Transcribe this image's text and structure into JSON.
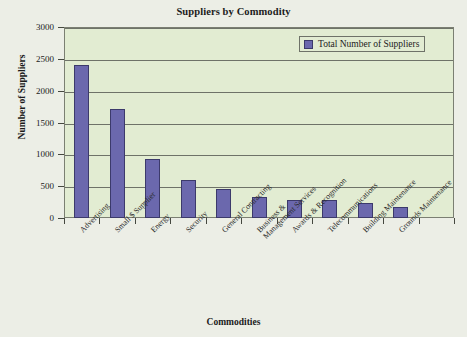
{
  "chart_data": {
    "type": "bar",
    "title": "Suppliers by Commodity",
    "xlabel": "Commodities",
    "ylabel": "Number of Suppliers",
    "ylim": [
      0,
      3000
    ],
    "ytick_step": 500,
    "yticks": [
      0,
      500,
      1000,
      1500,
      2000,
      2500,
      3000
    ],
    "ytick_labels": [
      "0",
      "500",
      "1000",
      "1500",
      "2000",
      "2500",
      "3000"
    ],
    "grid": true,
    "legend_position": "top-right",
    "legend": [
      "Total Number of Suppliers"
    ],
    "categories": [
      "Advertising",
      "Small $ Supplier",
      "Energy",
      "Security",
      "General Contracting",
      "Business & Management Services",
      "Awards & Recognition",
      "Telecommunications",
      "Building Maintenance",
      "Grounds Maintenance"
    ],
    "series": [
      {
        "name": "Total Number of Suppliers",
        "color": "#6B68AD",
        "values": [
          2400,
          1710,
          930,
          600,
          450,
          330,
          280,
          285,
          230,
          180
        ]
      }
    ],
    "bar_count": 11,
    "plot_background": "#E2ECD2",
    "page_background": "#ECEEE6",
    "axis_color": "#6E7268"
  },
  "category_label_lines": [
    [
      "Advertising",
      ""
    ],
    [
      "Small $ Supplier",
      ""
    ],
    [
      "Energy",
      ""
    ],
    [
      "Security",
      ""
    ],
    [
      "General Contracting",
      ""
    ],
    [
      "Business &",
      "Management Services"
    ],
    [
      "Awards & Recognition",
      ""
    ],
    [
      "Telecommunications",
      ""
    ],
    [
      "Building Maintenance",
      ""
    ],
    [
      "Grounds Maintenance",
      ""
    ]
  ]
}
